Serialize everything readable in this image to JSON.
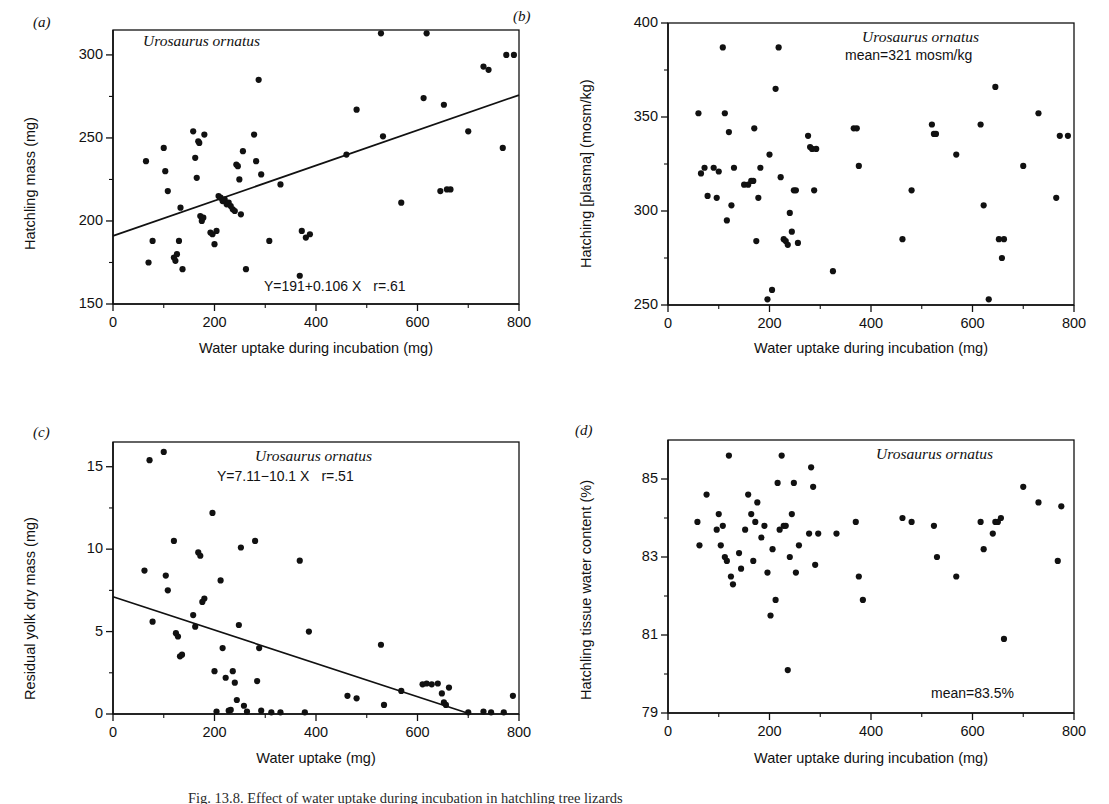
{
  "figure": {
    "caption_fragment": "Fig. 13.8.  Effect of water uptake during incubation in hatchling tree lizards"
  },
  "panels": [
    {
      "id": "a",
      "letter": "(a)",
      "species_annotation": "Urosaurus ornatus",
      "equation": "Y=191+0.106 X",
      "correlation": "r=.61",
      "mean_annotation": "",
      "xlabel": "Water uptake during incubation (mg)",
      "ylabel": "Hatchling mass (mg)",
      "xticks": [
        "0",
        "200",
        "400",
        "600",
        "800"
      ],
      "yticks": [
        "300",
        "250",
        "200",
        "150"
      ]
    },
    {
      "id": "b",
      "letter": "(b)",
      "species_annotation": "Urosaurus ornatus",
      "equation": "",
      "correlation": "",
      "mean_annotation": "mean=321 mosm/kg",
      "xlabel": "Water uptake during incubation (mg)",
      "ylabel": "Hatching [plasma] (mosm/kg)",
      "xticks": [
        "0",
        "200",
        "400",
        "600",
        "800"
      ],
      "yticks": [
        "400",
        "350",
        "300",
        "250"
      ]
    },
    {
      "id": "c",
      "letter": "(c)",
      "species_annotation": "Urosaurus ornatus",
      "equation": "Y=7.11−10.1 X",
      "correlation": "r=.51",
      "mean_annotation": "",
      "xlabel": "Water uptake (mg)",
      "ylabel": "Residual yolk dry mass (mg)",
      "xticks": [
        "0",
        "200",
        "400",
        "600",
        "800"
      ],
      "yticks": [
        "15",
        "10",
        "5",
        "0"
      ]
    },
    {
      "id": "d",
      "letter": "(d)",
      "species_annotation": "Urosaurus ornatus",
      "equation": "",
      "correlation": "",
      "mean_annotation": "mean=83.5%",
      "xlabel": "Water uptake during incubation (mg)",
      "ylabel": "Hatchling tissue water content (%)",
      "xticks": [
        "0",
        "200",
        "400",
        "600",
        "800"
      ],
      "yticks": [
        "85",
        "83",
        "81",
        "79"
      ]
    }
  ],
  "chart_data": [
    {
      "panel": "a",
      "type": "scatter",
      "title": "Urosaurus ornatus",
      "xlabel": "Water uptake during incubation (mg)",
      "ylabel": "Hatchling mass (mg)",
      "xlim": [
        0,
        800
      ],
      "ylim": [
        150,
        315
      ],
      "xticks": [
        0,
        200,
        400,
        600,
        800
      ],
      "yticks": [
        150,
        200,
        250,
        300
      ],
      "grid": false,
      "legend": "none",
      "fit": {
        "intercept": 191,
        "slope": 0.106,
        "r": 0.61,
        "label": "Y=191+0.106 X   r=.61"
      },
      "x": [
        65,
        70,
        78,
        100,
        103,
        108,
        120,
        123,
        126,
        130,
        133,
        137,
        158,
        162,
        165,
        168,
        170,
        172,
        175,
        178,
        180,
        192,
        196,
        200,
        204,
        208,
        212,
        216,
        220,
        224,
        228,
        232,
        236,
        240,
        243,
        246,
        249,
        252,
        256,
        262,
        278,
        282,
        287,
        292,
        308,
        330,
        368,
        372,
        380,
        388,
        460,
        480,
        528,
        532,
        568,
        612,
        618,
        645,
        652,
        658,
        665,
        700,
        730,
        740,
        768,
        775,
        790
      ],
      "y": [
        236,
        175,
        188,
        244,
        230,
        218,
        178,
        176,
        180,
        188,
        208,
        171,
        254,
        238,
        226,
        248,
        247,
        203,
        200,
        202,
        252,
        193,
        192,
        186,
        194,
        215,
        214,
        212,
        213,
        210,
        211,
        209,
        207,
        206,
        234,
        233,
        225,
        204,
        242,
        171,
        252,
        236,
        285,
        228,
        188,
        222,
        167,
        194,
        190,
        192,
        240,
        267,
        313,
        251,
        211,
        274,
        313,
        218,
        270,
        219,
        219,
        254,
        293,
        291,
        244,
        300,
        300
      ]
    },
    {
      "panel": "b",
      "type": "scatter",
      "title": "Urosaurus ornatus",
      "xlabel": "Water uptake during incubation (mg)",
      "ylabel": "Hatching [plasma] (mosm/kg)",
      "xlim": [
        0,
        800
      ],
      "ylim": [
        250,
        400
      ],
      "xticks": [
        0,
        200,
        400,
        600,
        800
      ],
      "yticks": [
        250,
        300,
        350,
        400
      ],
      "grid": false,
      "legend": "none",
      "mean": 321,
      "mean_label": "mean=321 mosm/kg",
      "x": [
        60,
        65,
        72,
        78,
        90,
        96,
        100,
        108,
        112,
        116,
        120,
        125,
        130,
        150,
        158,
        164,
        168,
        170,
        174,
        178,
        182,
        196,
        200,
        205,
        212,
        218,
        222,
        228,
        232,
        236,
        240,
        244,
        248,
        252,
        256,
        276,
        280,
        284,
        288,
        292,
        325,
        366,
        372,
        376,
        462,
        480,
        520,
        524,
        528,
        568,
        616,
        622,
        632,
        645,
        652,
        658,
        662,
        700,
        730,
        765,
        772,
        788
      ],
      "y": [
        352,
        320,
        323,
        308,
        323,
        307,
        321,
        387,
        352,
        295,
        342,
        303,
        323,
        314,
        314,
        316,
        316,
        344,
        284,
        307,
        323,
        253,
        330,
        258,
        365,
        387,
        318,
        285,
        284,
        282,
        299,
        289,
        311,
        311,
        283,
        340,
        334,
        333,
        311,
        333,
        268,
        344,
        344,
        324,
        285,
        311,
        346,
        341,
        341,
        330,
        346,
        303,
        253,
        366,
        285,
        275,
        285,
        324,
        352,
        307,
        340,
        340
      ]
    },
    {
      "panel": "c",
      "type": "scatter",
      "title": "Urosaurus ornatus",
      "xlabel": "Water uptake (mg)",
      "ylabel": "Residual yolk dry mass (mg)",
      "xlim": [
        0,
        800
      ],
      "ylim": [
        0,
        16.5
      ],
      "xticks": [
        0,
        200,
        400,
        600,
        800
      ],
      "yticks": [
        0,
        5,
        10,
        15
      ],
      "grid": false,
      "legend": "none",
      "fit": {
        "intercept": 7.11,
        "slope": -0.0101,
        "r": 0.51,
        "label": "Y=7.11−10.1 X   r=.51"
      },
      "x": [
        62,
        72,
        78,
        100,
        104,
        108,
        120,
        124,
        128,
        132,
        136,
        158,
        162,
        168,
        172,
        176,
        180,
        196,
        200,
        204,
        212,
        216,
        222,
        228,
        232,
        236,
        240,
        244,
        248,
        252,
        258,
        264,
        280,
        284,
        288,
        292,
        312,
        330,
        368,
        378,
        386,
        462,
        480,
        528,
        534,
        568,
        610,
        618,
        628,
        640,
        648,
        652,
        656,
        662,
        700,
        730,
        745,
        770,
        788
      ],
      "y": [
        8.7,
        15.4,
        5.6,
        15.9,
        8.4,
        7.5,
        10.5,
        4.9,
        4.7,
        3.5,
        3.6,
        6.0,
        5.3,
        9.8,
        9.6,
        6.8,
        7.0,
        12.2,
        2.6,
        0.15,
        8.1,
        4.0,
        2.2,
        0.2,
        0.25,
        2.6,
        1.9,
        0.85,
        5.4,
        10.1,
        0.5,
        0.15,
        10.5,
        2.0,
        4.0,
        0.2,
        0.1,
        0.1,
        9.3,
        0.1,
        5.0,
        1.1,
        0.95,
        4.2,
        0.55,
        1.4,
        1.8,
        1.85,
        1.8,
        1.85,
        1.25,
        0.7,
        0.55,
        1.6,
        0.1,
        0.15,
        0.1,
        0.1,
        1.1
      ]
    },
    {
      "panel": "d",
      "type": "scatter",
      "title": "Urosaurus ornatus",
      "xlabel": "Water uptake during incubation (mg)",
      "ylabel": "Hatchling tissue water content (%)",
      "xlim": [
        0,
        800
      ],
      "ylim": [
        79,
        86
      ],
      "xticks": [
        0,
        200,
        400,
        600,
        800
      ],
      "yticks": [
        79,
        81,
        83,
        85
      ],
      "grid": false,
      "legend": "none",
      "mean": 83.5,
      "mean_label": "mean=83.5%",
      "x": [
        58,
        62,
        76,
        96,
        100,
        104,
        108,
        112,
        116,
        120,
        124,
        128,
        140,
        144,
        152,
        158,
        164,
        168,
        172,
        176,
        184,
        190,
        196,
        202,
        206,
        212,
        216,
        220,
        224,
        228,
        232,
        236,
        240,
        244,
        248,
        252,
        258,
        278,
        282,
        286,
        290,
        296,
        332,
        370,
        376,
        384,
        462,
        480,
        524,
        530,
        568,
        616,
        622,
        640,
        645,
        650,
        656,
        662,
        700,
        730,
        768,
        775
      ],
      "y": [
        83.9,
        83.3,
        84.6,
        83.7,
        84.1,
        83.3,
        83.8,
        83.0,
        82.9,
        85.6,
        82.5,
        82.3,
        83.1,
        82.7,
        83.7,
        84.6,
        84.1,
        82.9,
        83.9,
        84.4,
        83.5,
        83.8,
        82.6,
        81.5,
        83.2,
        81.9,
        84.9,
        83.7,
        85.6,
        83.8,
        83.8,
        80.1,
        83.0,
        84.1,
        84.9,
        82.6,
        83.3,
        83.6,
        85.3,
        84.8,
        82.8,
        83.6,
        83.6,
        83.9,
        82.5,
        81.9,
        84.0,
        83.9,
        83.8,
        83.0,
        82.5,
        83.9,
        83.2,
        83.6,
        83.9,
        83.9,
        84.0,
        80.9,
        84.8,
        84.4,
        82.9,
        84.3
      ]
    }
  ]
}
